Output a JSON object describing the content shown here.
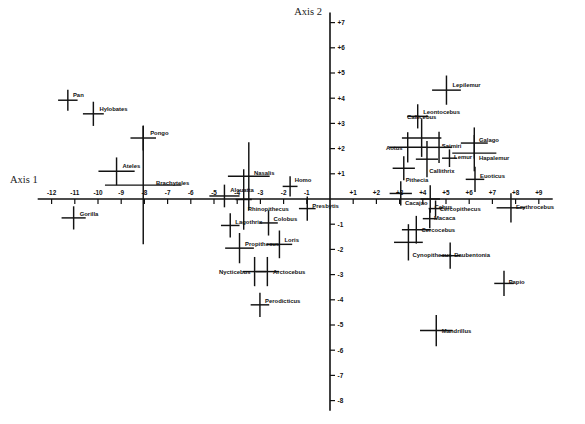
{
  "chart_data": {
    "type": "scatter",
    "title": "",
    "xlabel": "Axis 1",
    "ylabel": "Axis 2",
    "xlim": [
      -12.6,
      9.6
    ],
    "ylim": [
      -8.4,
      7.4
    ],
    "grid": false,
    "legend": "none",
    "axis_style": "centered-crosshair",
    "marker": "cross-with-error-bars",
    "xticks": [
      -12,
      -11,
      -10,
      -9,
      -8,
      -7,
      -6,
      -5,
      -4,
      -3,
      -2,
      -1,
      1,
      2,
      3,
      4,
      5,
      6,
      7,
      8,
      9
    ],
    "xtick_labels": [
      "-12",
      "-11",
      "-10",
      "-9",
      "-8",
      "-7",
      "-6",
      "-5",
      "-4",
      "-3",
      "-2",
      "-1",
      "+1",
      "+2",
      "+3",
      "+4",
      "+5",
      "+6",
      "+7",
      "+8",
      "+9"
    ],
    "yticks": [
      7,
      6,
      5,
      4,
      3,
      2,
      1,
      -1,
      -2,
      -3,
      -4,
      -5,
      -6,
      -7,
      -8
    ],
    "ytick_labels": [
      "+7",
      "+6",
      "+5",
      "+4",
      "+3",
      "+2",
      "+1",
      "-1",
      "-2",
      "-3",
      "-4",
      "-5",
      "-6",
      "-7",
      "-8"
    ],
    "points": [
      {
        "label": "Pan",
        "x": -11.3,
        "y": 3.92,
        "xerr": 0.42,
        "yerr": 0.42,
        "lx": 0.22,
        "ly": -0.22
      },
      {
        "label": "Hylobates",
        "x": -10.2,
        "y": 3.38,
        "xerr": 0.45,
        "yerr": 0.48,
        "lx": 0.26,
        "ly": -0.2
      },
      {
        "label": "Pongo",
        "x": -8.05,
        "y": 2.42,
        "xerr": 0.55,
        "yerr": 0.5,
        "lx": 0.3,
        "ly": -0.2
      },
      {
        "label": "Ateles",
        "x": -9.2,
        "y": 1.1,
        "xerr": 0.78,
        "yerr": 0.55,
        "lx": 0.26,
        "ly": -0.22
      },
      {
        "label": "Brachyteles",
        "x": -8.05,
        "y": 0.55,
        "xerr": 1.65,
        "yerr": 2.35,
        "lx": 0.55,
        "ly": -0.1
      },
      {
        "label": "Gorilla",
        "x": -11.05,
        "y": -0.75,
        "xerr": 0.52,
        "yerr": 0.46,
        "lx": 0.26,
        "ly": -0.14
      },
      {
        "label": "Nasalis",
        "x": -3.5,
        "y": 0.9,
        "xerr": 0.9,
        "yerr": 1.35,
        "lx": 0.22,
        "ly": -0.12
      },
      {
        "label": "Alouatta",
        "x": -4.55,
        "y": 0.12,
        "xerr": 0.65,
        "yerr": 0.45,
        "lx": 0.25,
        "ly": -0.24
      },
      {
        "label": "Rhinopithecus",
        "x": -3.72,
        "y": -0.02,
        "xerr": 0.35,
        "yerr": 1.2,
        "lx": 0.18,
        "ly": 0.38
      },
      {
        "label": "Homo",
        "x": -1.72,
        "y": 0.5,
        "xerr": 0.32,
        "yerr": 0.4,
        "lx": 0.2,
        "ly": -0.24
      },
      {
        "label": "Presbytis",
        "x": -0.98,
        "y": -0.38,
        "xerr": 0.36,
        "yerr": 0.48,
        "lx": 0.22,
        "ly": -0.12
      },
      {
        "label": "Lagothrix",
        "x": -4.3,
        "y": -1.05,
        "xerr": 0.4,
        "yerr": 0.48,
        "lx": 0.22,
        "ly": -0.16
      },
      {
        "label": "Colobus",
        "x": -2.65,
        "y": -0.95,
        "xerr": 0.4,
        "yerr": 0.5,
        "lx": 0.22,
        "ly": -0.18
      },
      {
        "label": "Propithecus",
        "x": -3.9,
        "y": -1.95,
        "xerr": 0.62,
        "yerr": 0.6,
        "lx": 0.24,
        "ly": -0.18
      },
      {
        "label": "Loris",
        "x": -2.18,
        "y": -1.8,
        "xerr": 0.55,
        "yerr": 0.55,
        "lx": 0.22,
        "ly": -0.18
      },
      {
        "label": "Nycticebus",
        "x": -3.25,
        "y": -2.88,
        "xerr": 0.5,
        "yerr": 0.58,
        "lx": -0.18,
        "ly": 0.02,
        "anchor": "end"
      },
      {
        "label": "Arctocebus",
        "x": -2.7,
        "y": -2.88,
        "xerr": 0.5,
        "yerr": 0.58,
        "lx": 0.24,
        "ly": 0.02
      },
      {
        "label": "Perodicticus",
        "x": -3.02,
        "y": -4.2,
        "xerr": 0.4,
        "yerr": 0.48,
        "lx": 0.22,
        "ly": -0.16
      },
      {
        "label": "Lepilemur",
        "x": 5.02,
        "y": 4.32,
        "xerr": 0.62,
        "yerr": 0.58,
        "lx": 0.26,
        "ly": -0.2
      },
      {
        "label": "Leontocebus",
        "x": 3.78,
        "y": 3.28,
        "xerr": 0.45,
        "yerr": 0.48,
        "lx": 0.24,
        "ly": -0.18
      },
      {
        "label": "Callicebus",
        "x": 3.95,
        "y": 2.42,
        "xerr": 0.85,
        "yerr": 0.75,
        "lx": 0.0,
        "ly": -0.82,
        "anchor": "middle"
      },
      {
        "label": "Aotus",
        "x": 3.35,
        "y": 2.05,
        "xerr": 0.8,
        "yerr": 0.6,
        "lx": -0.22,
        "ly": 0.02,
        "anchor": "end"
      },
      {
        "label": "Saimiri",
        "x": 4.7,
        "y": 2.05,
        "xerr": 0.55,
        "yerr": 0.62,
        "lx": 0.12,
        "ly": -0.05
      },
      {
        "label": "Lemur",
        "x": 5.15,
        "y": 1.62,
        "xerr": 0.32,
        "yerr": 0.35,
        "lx": 0.2,
        "ly": -0.05
      },
      {
        "label": "Callithrix",
        "x": 4.18,
        "y": 1.58,
        "xerr": 0.48,
        "yerr": 0.72,
        "lx": 0.1,
        "ly": 0.45
      },
      {
        "label": "Pithecia",
        "x": 3.18,
        "y": 1.22,
        "xerr": 0.48,
        "yerr": 0.48,
        "lx": 0.08,
        "ly": 0.48
      },
      {
        "label": "Galago",
        "x": 6.22,
        "y": 2.22,
        "xerr": 0.58,
        "yerr": 0.62,
        "lx": 0.2,
        "ly": -0.12
      },
      {
        "label": "Hapalemur",
        "x": 6.22,
        "y": 1.82,
        "xerr": 0.95,
        "yerr": 0.72,
        "lx": 0.2,
        "ly": 0.18
      },
      {
        "label": "Euoticus",
        "x": 6.25,
        "y": 0.78,
        "xerr": 0.4,
        "yerr": 0.5,
        "lx": 0.22,
        "ly": -0.12
      },
      {
        "label": "Cacajao",
        "x": 3.05,
        "y": 0.22,
        "xerr": 0.48,
        "yerr": 0.48,
        "lx": 0.18,
        "ly": 0.38
      },
      {
        "label": "Cebus",
        "x": 4.32,
        "y": 0.0,
        "xerr": 0.42,
        "yerr": 0.55,
        "lx": 0.18,
        "ly": 0.32
      },
      {
        "label": "Cercopithecus",
        "x": 4.55,
        "y": -0.38,
        "xerr": 0.3,
        "yerr": 0.32,
        "lx": 0.18,
        "ly": 0.02
      },
      {
        "label": "Macaca",
        "x": 4.3,
        "y": -0.78,
        "xerr": 0.3,
        "yerr": 0.38,
        "lx": 0.18,
        "ly": -0.02
      },
      {
        "label": "Cercocebus",
        "x": 3.72,
        "y": -1.22,
        "xerr": 0.62,
        "yerr": 0.55,
        "lx": 0.22,
        "ly": 0.0
      },
      {
        "label": "Cynopithecus",
        "x": 3.38,
        "y": -1.72,
        "xerr": 0.62,
        "yerr": 0.72,
        "lx": 0.18,
        "ly": 0.5
      },
      {
        "label": "Erythrocebus",
        "x": 7.8,
        "y": -0.35,
        "xerr": 0.62,
        "yerr": 0.58,
        "lx": 0.22,
        "ly": -0.05
      },
      {
        "label": "Daubentonia",
        "x": 5.18,
        "y": -2.25,
        "xerr": 0.42,
        "yerr": 0.52,
        "lx": 0.18,
        "ly": -0.02
      },
      {
        "label": "Papio",
        "x": 7.5,
        "y": -3.35,
        "xerr": 0.42,
        "yerr": 0.5,
        "lx": 0.2,
        "ly": -0.05
      },
      {
        "label": "Mandrillus",
        "x": 4.58,
        "y": -5.22,
        "xerr": 0.7,
        "yerr": 0.62,
        "lx": 0.24,
        "ly": 0.02
      }
    ]
  }
}
